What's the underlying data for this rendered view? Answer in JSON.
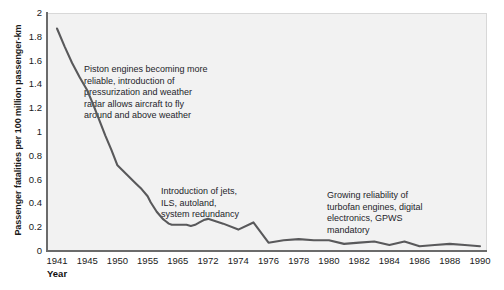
{
  "chart_data": {
    "type": "line",
    "title": "",
    "xlabel": "Year",
    "ylabel": "Passenger fatalities per 100 million passenger-km",
    "ylim": [
      0,
      2
    ],
    "yticks": [
      0,
      0.2,
      0.4,
      0.6,
      0.8,
      1,
      1.2,
      1.4,
      1.6,
      1.8,
      2
    ],
    "ytick_labels": [
      "0",
      "0.2",
      "0.4",
      "0.6",
      "0.8",
      "1",
      "1.2",
      "1.4",
      "1.6",
      "1.8",
      "2"
    ],
    "xtick_labels": [
      "1941",
      "1945",
      "1950",
      "1955",
      "1965",
      "1972",
      "1974",
      "1976",
      "1978",
      "1980",
      "1982",
      "1984",
      "1986",
      "1988",
      "1990"
    ],
    "grid": false,
    "legend": "none",
    "line_color": "#59595b",
    "plot_background": "#f2f2f2",
    "axis_color": "#6b6b6b",
    "series": [
      {
        "name": "Passenger fatalities per 100 million passenger-km",
        "x": [
          1941,
          1942,
          1943,
          1944,
          1945,
          1946,
          1947,
          1948,
          1949,
          1950,
          1951,
          1952,
          1953,
          1954,
          1955,
          1956,
          1957,
          1958,
          1959,
          1960,
          1961,
          1962,
          1963,
          1964,
          1965,
          1966,
          1967,
          1968,
          1969,
          1970,
          1971,
          1972,
          1973,
          1974,
          1975,
          1976,
          1977,
          1978,
          1979,
          1980,
          1981,
          1982,
          1983,
          1984,
          1985,
          1986,
          1987,
          1988,
          1989,
          1990
        ],
        "y": [
          1.87,
          1.72,
          1.58,
          1.46,
          1.35,
          1.23,
          1.1,
          0.97,
          0.85,
          0.72,
          0.67,
          0.62,
          0.57,
          0.52,
          0.46,
          0.41,
          0.37,
          0.33,
          0.3,
          0.27,
          0.25,
          0.23,
          0.22,
          0.22,
          0.22,
          0.22,
          0.22,
          0.21,
          0.22,
          0.24,
          0.26,
          0.27,
          0.23,
          0.18,
          0.24,
          0.07,
          0.09,
          0.1,
          0.09,
          0.09,
          0.06,
          0.07,
          0.08,
          0.05,
          0.08,
          0.04,
          0.05,
          0.06,
          0.05,
          0.04
        ]
      }
    ],
    "annotations": [
      {
        "id": "piston",
        "text": "Piston engines becoming more\nreliable, introduction of\npressurization and weather\nradar allows aircraft to fly\naround and above weather"
      },
      {
        "id": "jets",
        "text": "Introduction of jets,\nILS, autoland,\nsystem redundancy"
      },
      {
        "id": "turbofan",
        "text": "Growing reliability of\nturbofan engines, digital\nelectronics, GPWS\nmandatory"
      }
    ]
  }
}
